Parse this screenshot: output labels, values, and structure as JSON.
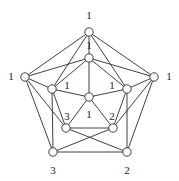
{
  "figure": {
    "type": "graph-diagram",
    "title": "",
    "width": 179,
    "height": 181,
    "background_color": "#ffffff",
    "edge_color": "#2b2b2b",
    "vertex_fill_color": "#ffffff",
    "label_color": "#1a1a1a"
  },
  "graph_data": {
    "type": "graph",
    "description": "Pentagon-based graph with outer, middle and inner vertices, each vertex annotated with an integer label",
    "vertices": [
      {
        "id": "outer-top",
        "label": "1",
        "x": 89,
        "y": 32,
        "r": 4.2,
        "label_x": 89,
        "label_y": 15
      },
      {
        "id": "outer-left",
        "label": "1",
        "x": 25,
        "y": 77,
        "r": 4.2,
        "label_x": 11,
        "label_y": 76
      },
      {
        "id": "outer-right",
        "label": "1",
        "x": 154,
        "y": 77,
        "r": 4.2,
        "label_x": 169,
        "label_y": 76
      },
      {
        "id": "outer-bottom-left",
        "label": "3",
        "x": 53,
        "y": 152,
        "r": 4.2,
        "label_x": 53,
        "label_y": 170
      },
      {
        "id": "outer-bottom-right",
        "label": "2",
        "x": 127,
        "y": 152,
        "r": 4.2,
        "label_x": 127,
        "label_y": 170
      },
      {
        "id": "inner-top",
        "label": "1",
        "x": 89,
        "y": 58,
        "r": 4.2,
        "label_x": 89,
        "label_y": 45
      },
      {
        "id": "inner-left",
        "label": "1",
        "x": 52,
        "y": 89,
        "r": 4.2,
        "label_x": 67,
        "label_y": 85
      },
      {
        "id": "inner-right",
        "label": "1",
        "x": 127,
        "y": 89,
        "r": 4.2,
        "label_x": 112,
        "label_y": 85
      },
      {
        "id": "inner-bottom-left",
        "label": "3",
        "x": 66,
        "y": 128,
        "r": 4.2,
        "label_x": 67,
        "label_y": 116
      },
      {
        "id": "inner-bottom-right",
        "label": "2",
        "x": 113,
        "y": 128,
        "r": 4.2,
        "label_x": 112,
        "label_y": 116
      },
      {
        "id": "center",
        "label": "1",
        "x": 89,
        "y": 97,
        "r": 4.2,
        "label_x": 89,
        "label_y": 114
      }
    ],
    "edges": [
      [
        "outer-top",
        "outer-left"
      ],
      [
        "outer-top",
        "outer-right"
      ],
      [
        "outer-left",
        "outer-bottom-left"
      ],
      [
        "outer-right",
        "outer-bottom-right"
      ],
      [
        "outer-bottom-left",
        "outer-bottom-right"
      ],
      [
        "outer-top",
        "inner-top"
      ],
      [
        "outer-left",
        "inner-left"
      ],
      [
        "outer-right",
        "inner-right"
      ],
      [
        "outer-bottom-left",
        "inner-left"
      ],
      [
        "outer-bottom-right",
        "inner-right"
      ],
      [
        "outer-top",
        "inner-left"
      ],
      [
        "outer-top",
        "inner-right"
      ],
      [
        "outer-left",
        "inner-top"
      ],
      [
        "outer-right",
        "inner-top"
      ],
      [
        "outer-left",
        "inner-bottom-left"
      ],
      [
        "outer-right",
        "inner-bottom-right"
      ],
      [
        "outer-bottom-left",
        "inner-bottom-right"
      ],
      [
        "outer-bottom-right",
        "inner-bottom-left"
      ],
      [
        "inner-top",
        "inner-left"
      ],
      [
        "inner-top",
        "inner-right"
      ],
      [
        "inner-left",
        "inner-bottom-left"
      ],
      [
        "inner-right",
        "inner-bottom-right"
      ],
      [
        "inner-bottom-left",
        "inner-bottom-right"
      ],
      [
        "inner-top",
        "center"
      ],
      [
        "inner-left",
        "center"
      ],
      [
        "inner-right",
        "center"
      ],
      [
        "inner-bottom-left",
        "center"
      ],
      [
        "inner-bottom-right",
        "center"
      ]
    ]
  }
}
